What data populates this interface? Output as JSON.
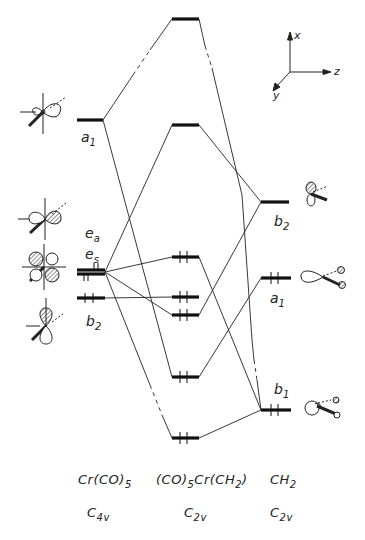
{
  "axes": {
    "x": "x",
    "y": "y",
    "z": "z"
  },
  "fragments": {
    "left": {
      "name": "Cr(CO)5",
      "name_main": "Cr(CO)",
      "name_sub": "5",
      "symmetry_main": "C",
      "symmetry_sub": "4v"
    },
    "center": {
      "name": "(CO)5Cr(CH2)",
      "name_a": "(CO)",
      "name_a_sub": "5",
      "name_b": "Cr(CH",
      "name_b_sub": "2",
      "name_c": ")",
      "symmetry_main": "C",
      "symmetry_sub": "2v"
    },
    "right": {
      "name": "CH2",
      "name_main": "CH",
      "name_sub": "2",
      "symmetry_main": "C",
      "symmetry_sub": "2v"
    }
  },
  "levels": {
    "left": [
      {
        "label_main": "a",
        "label_sub": "1",
        "y": 120,
        "electrons": 0
      },
      {
        "label_main": "e",
        "label_sub": "a",
        "y": 270,
        "electrons": 2
      },
      {
        "label_main": "e",
        "label_sub": "s",
        "y": 274,
        "electrons": 2
      },
      {
        "label_main": "b",
        "label_sub": "2",
        "y": 298,
        "electrons": 2
      }
    ],
    "center": [
      {
        "y": 19,
        "electrons": 0
      },
      {
        "y": 125,
        "electrons": 0
      },
      {
        "y": 257,
        "electrons": 2
      },
      {
        "y": 297,
        "electrons": 2
      },
      {
        "y": 315,
        "electrons": 2
      },
      {
        "y": 377,
        "electrons": 2
      },
      {
        "y": 438,
        "electrons": 2
      }
    ],
    "right": [
      {
        "label_main": "b",
        "label_sub": "2",
        "y": 202,
        "electrons": 0
      },
      {
        "label_main": "a",
        "label_sub": "1",
        "y": 278,
        "electrons": 2
      },
      {
        "label_main": "b",
        "label_sub": "1",
        "y": 410,
        "electrons": 2
      }
    ]
  },
  "colors": {
    "ink": "#1a1a1a",
    "background": "#ffffff"
  }
}
